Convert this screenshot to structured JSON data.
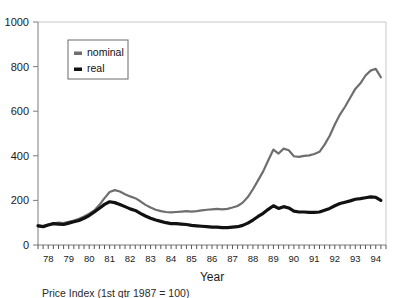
{
  "chart_data": {
    "type": "line",
    "title": "",
    "xlabel": "Year",
    "ylabel": "",
    "caption": "Price Index (1st qtr 1987 = 100)",
    "xlim": [
      1978,
      1995
    ],
    "ylim": [
      0,
      1000
    ],
    "grid": false,
    "legend_position": "top-left-inside",
    "y_ticks": [
      0,
      200,
      400,
      600,
      800,
      1000
    ],
    "y_tick_labels": [
      "0",
      "200",
      "400",
      "600",
      "800",
      "1000"
    ],
    "x_tick_labels": [
      "78",
      "79",
      "80",
      "81",
      "82",
      "83",
      "84",
      "85",
      "86",
      "87",
      "88",
      "89",
      "90",
      "91",
      "92",
      "93",
      "94"
    ],
    "x_minor_ticks_per_year": 4,
    "colors": {
      "nominal": "#6e6e6e",
      "real": "#111111",
      "axis": "#7d7d7d",
      "frame": "#c9c9c9"
    },
    "series": [
      {
        "name": "nominal",
        "color": "#6e6e6e",
        "x": [
          1978.0,
          1978.25,
          1978.5,
          1978.75,
          1979.0,
          1979.25,
          1979.5,
          1979.75,
          1980.0,
          1980.25,
          1980.5,
          1980.75,
          1981.0,
          1981.25,
          1981.5,
          1981.75,
          1982.0,
          1982.25,
          1982.5,
          1982.75,
          1983.0,
          1983.25,
          1983.5,
          1983.75,
          1984.0,
          1984.25,
          1984.5,
          1984.75,
          1985.0,
          1985.25,
          1985.5,
          1985.75,
          1986.0,
          1986.25,
          1986.5,
          1986.75,
          1987.0,
          1987.25,
          1987.5,
          1987.75,
          1988.0,
          1988.25,
          1988.5,
          1988.75,
          1989.0,
          1989.25,
          1989.5,
          1989.75,
          1990.0,
          1990.25,
          1990.5,
          1990.75,
          1991.0,
          1991.25,
          1991.5,
          1991.75,
          1992.0,
          1992.25,
          1992.5,
          1992.75,
          1993.0,
          1993.25,
          1993.5,
          1993.75,
          1994.0,
          1994.25,
          1994.5,
          1994.75
        ],
        "y": [
          88,
          86,
          92,
          96,
          100,
          98,
          104,
          110,
          118,
          128,
          140,
          155,
          180,
          210,
          238,
          246,
          240,
          228,
          218,
          210,
          196,
          180,
          168,
          158,
          152,
          148,
          146,
          148,
          150,
          152,
          150,
          152,
          155,
          158,
          160,
          162,
          160,
          162,
          168,
          175,
          190,
          215,
          250,
          290,
          330,
          380,
          428,
          410,
          432,
          425,
          398,
          395,
          400,
          402,
          408,
          418,
          450,
          490,
          540,
          585,
          620,
          660,
          700,
          725,
          760,
          782,
          790,
          752
        ]
      },
      {
        "name": "real",
        "color": "#111111",
        "x": [
          1978.0,
          1978.25,
          1978.5,
          1978.75,
          1979.0,
          1979.25,
          1979.5,
          1979.75,
          1980.0,
          1980.25,
          1980.5,
          1980.75,
          1981.0,
          1981.25,
          1981.5,
          1981.75,
          1982.0,
          1982.25,
          1982.5,
          1982.75,
          1983.0,
          1983.25,
          1983.5,
          1983.75,
          1984.0,
          1984.25,
          1984.5,
          1984.75,
          1985.0,
          1985.25,
          1985.5,
          1985.75,
          1986.0,
          1986.25,
          1986.5,
          1986.75,
          1987.0,
          1987.25,
          1987.5,
          1987.75,
          1988.0,
          1988.25,
          1988.5,
          1988.75,
          1989.0,
          1989.25,
          1989.5,
          1989.75,
          1990.0,
          1990.25,
          1990.5,
          1990.75,
          1991.0,
          1991.25,
          1991.5,
          1991.75,
          1992.0,
          1992.25,
          1992.5,
          1992.75,
          1993.0,
          1993.25,
          1993.5,
          1993.75,
          1994.0,
          1994.25,
          1994.5,
          1994.75
        ],
        "y": [
          86,
          82,
          90,
          96,
          94,
          92,
          98,
          104,
          110,
          120,
          132,
          148,
          165,
          182,
          194,
          190,
          182,
          172,
          162,
          155,
          142,
          130,
          120,
          112,
          106,
          100,
          96,
          96,
          94,
          92,
          88,
          86,
          84,
          82,
          80,
          80,
          78,
          78,
          80,
          82,
          88,
          98,
          112,
          128,
          142,
          160,
          176,
          164,
          172,
          166,
          152,
          148,
          148,
          146,
          146,
          148,
          156,
          164,
          176,
          186,
          192,
          198,
          205,
          208,
          212,
          216,
          214,
          200
        ]
      }
    ]
  },
  "legend": {
    "entries": [
      {
        "label": "nominal",
        "color": "#6e6e6e"
      },
      {
        "label": "real",
        "color": "#111111"
      }
    ]
  }
}
